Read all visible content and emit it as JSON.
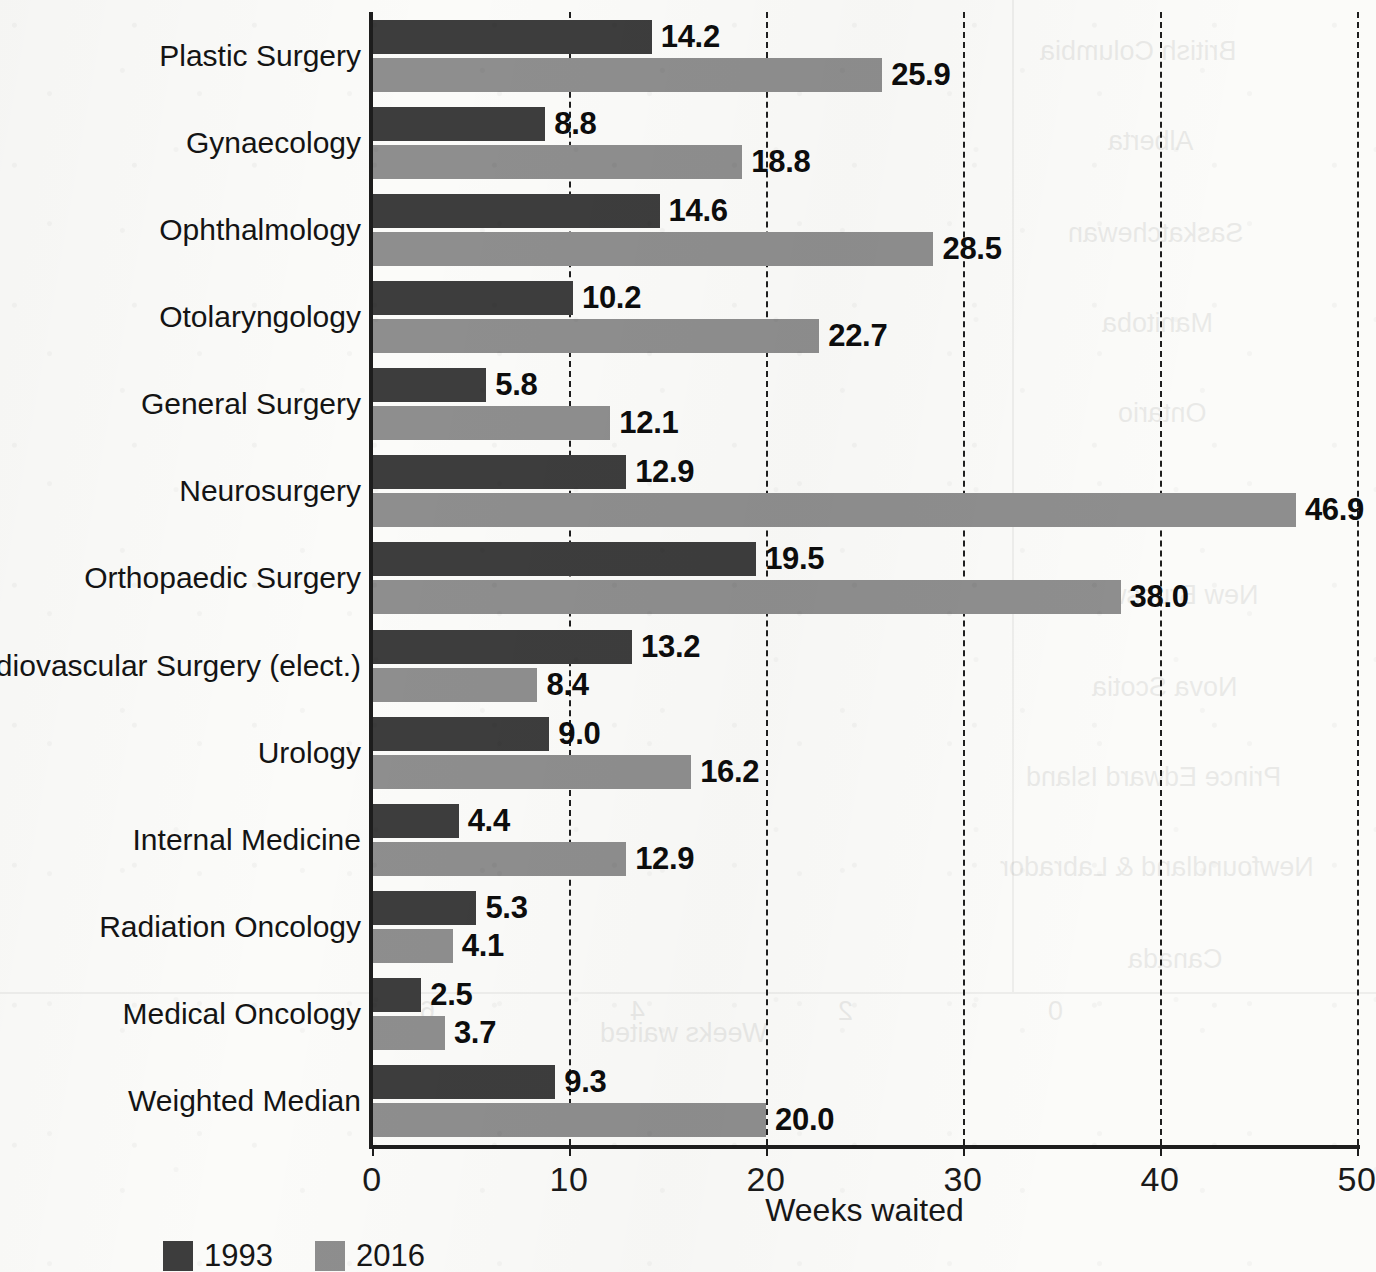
{
  "chart_data": {
    "type": "bar",
    "orientation": "horizontal",
    "title": "",
    "xlabel": "Weeks waited",
    "ylabel": "",
    "xlim": [
      0,
      50
    ],
    "xticks": [
      0,
      10,
      20,
      30,
      40,
      50
    ],
    "xtick_labels": [
      "0",
      "10",
      "20",
      "30",
      "40",
      "50"
    ],
    "grid": "vertical-dashed",
    "legend_position": "bottom-left",
    "categories": [
      "Plastic Surgery",
      "Gynaecology",
      "Ophthalmology",
      "Otolaryngology",
      "General Surgery",
      "Neurosurgery",
      "Orthopaedic Surgery",
      "Cardiovascular Surgery (elect.)",
      "Urology",
      "Internal Medicine",
      "Radiation Oncology",
      "Medical Oncology",
      "Weighted Median"
    ],
    "series": [
      {
        "name": "1993",
        "color": "#3d3d3d",
        "values": [
          14.2,
          8.8,
          14.6,
          10.2,
          5.8,
          12.9,
          19.5,
          13.2,
          9.0,
          4.4,
          5.3,
          2.5,
          9.3
        ],
        "labels": [
          "14.2",
          "8.8",
          "14.6",
          "10.2",
          "5.8",
          "12.9",
          "19.5",
          "13.2",
          "9.0",
          "4.4",
          "5.3",
          "2.5",
          "9.3"
        ]
      },
      {
        "name": "2016",
        "color": "#8e8e8e",
        "values": [
          25.9,
          18.8,
          28.5,
          22.7,
          12.1,
          46.9,
          38.0,
          8.4,
          16.2,
          12.9,
          4.1,
          3.7,
          20.0
        ],
        "labels": [
          "25.9",
          "18.8",
          "28.5",
          "22.7",
          "12.1",
          "46.9",
          "38.0",
          "8.4",
          "16.2",
          "12.9",
          "4.1",
          "3.7",
          "20.0"
        ]
      }
    ]
  },
  "legend": {
    "items": [
      {
        "label": "1993",
        "color": "#3d3d3d"
      },
      {
        "label": "2016",
        "color": "#8e8e8e"
      }
    ]
  },
  "axis": {
    "x_title": "Weeks waited"
  },
  "background_bleed": {
    "note": "faint mirrored show-through from reverse of printed page",
    "items": [
      "British Columbia",
      "Alberta",
      "Saskatchewan",
      "Manitoba",
      "Ontario",
      "Quebec",
      "New Brunswick",
      "Nova Scotia",
      "Prince Edward Island",
      "Newfoundland & Labrador",
      "Canada",
      "Weeks waited",
      "0",
      "2",
      "4",
      "6"
    ]
  }
}
